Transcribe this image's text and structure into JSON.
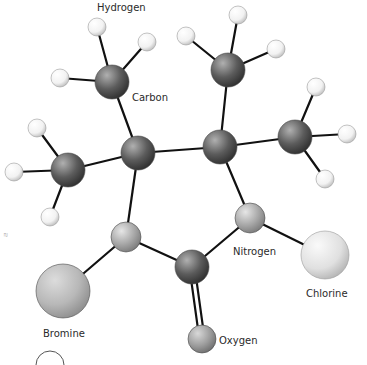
{
  "diagram": {
    "type": "ball-and-stick molecular model",
    "labels": {
      "hydrogen": "Hydrogen",
      "carbon": "Carbon",
      "nitrogen": "Nitrogen",
      "chlorine": "Chlorine",
      "bromine": "Bromine",
      "oxygen": "Oxygen"
    },
    "colors": {
      "carbon": "#5a5a5a",
      "nitrogen": "#a6a6a6",
      "hydrogen": "#f4f4f4",
      "chlorine": "#e2e2e2",
      "bromine": "#b8b8b8",
      "oxygen": "#9c9c9c",
      "bond": "#111111"
    },
    "atoms": [
      {
        "id": "c_ring_left",
        "element": "carbon",
        "x": 138,
        "y": 153,
        "r": 17
      },
      {
        "id": "c_ring_right",
        "element": "carbon",
        "x": 220,
        "y": 147,
        "r": 17
      },
      {
        "id": "n_ring_left",
        "element": "nitrogen",
        "x": 126,
        "y": 237,
        "r": 15
      },
      {
        "id": "n_ring_right",
        "element": "nitrogen",
        "x": 250,
        "y": 218,
        "r": 15
      },
      {
        "id": "c_carbonyl",
        "element": "carbon",
        "x": 192,
        "y": 267,
        "r": 17
      },
      {
        "id": "c_methyl_tl",
        "element": "carbon",
        "x": 112,
        "y": 82,
        "r": 17
      },
      {
        "id": "c_methyl_tr",
        "element": "carbon",
        "x": 228,
        "y": 70,
        "r": 17
      },
      {
        "id": "c_methyl_l",
        "element": "carbon",
        "x": 68,
        "y": 170,
        "r": 17
      },
      {
        "id": "c_methyl_r",
        "element": "carbon",
        "x": 295,
        "y": 137,
        "r": 17
      },
      {
        "id": "o",
        "element": "oxygen",
        "x": 202,
        "y": 339,
        "r": 14
      },
      {
        "id": "br",
        "element": "bromine",
        "x": 63,
        "y": 291,
        "r": 27
      },
      {
        "id": "cl",
        "element": "chlorine",
        "x": 325,
        "y": 255,
        "r": 24
      },
      {
        "id": "h1",
        "element": "hydrogen",
        "x": 97,
        "y": 27,
        "r": 9
      },
      {
        "id": "h2",
        "element": "hydrogen",
        "x": 147,
        "y": 42,
        "r": 9
      },
      {
        "id": "h3",
        "element": "hydrogen",
        "x": 60,
        "y": 78,
        "r": 9
      },
      {
        "id": "h4",
        "element": "hydrogen",
        "x": 238,
        "y": 15,
        "r": 9
      },
      {
        "id": "h5",
        "element": "hydrogen",
        "x": 186,
        "y": 36,
        "r": 9
      },
      {
        "id": "h6",
        "element": "hydrogen",
        "x": 276,
        "y": 49,
        "r": 9
      },
      {
        "id": "h7",
        "element": "hydrogen",
        "x": 37,
        "y": 128,
        "r": 9
      },
      {
        "id": "h8",
        "element": "hydrogen",
        "x": 14,
        "y": 172,
        "r": 9
      },
      {
        "id": "h9",
        "element": "hydrogen",
        "x": 50,
        "y": 217,
        "r": 9
      },
      {
        "id": "h10",
        "element": "hydrogen",
        "x": 316,
        "y": 87,
        "r": 9
      },
      {
        "id": "h11",
        "element": "hydrogen",
        "x": 347,
        "y": 134,
        "r": 9
      },
      {
        "id": "h12",
        "element": "hydrogen",
        "x": 325,
        "y": 179,
        "r": 9
      }
    ],
    "bonds": [
      [
        "c_ring_left",
        "c_ring_right",
        1
      ],
      [
        "c_ring_right",
        "n_ring_right",
        1
      ],
      [
        "n_ring_right",
        "c_carbonyl",
        1
      ],
      [
        "c_carbonyl",
        "n_ring_left",
        1
      ],
      [
        "n_ring_left",
        "c_ring_left",
        1
      ],
      [
        "c_carbonyl",
        "o",
        2
      ],
      [
        "n_ring_left",
        "br",
        1
      ],
      [
        "n_ring_right",
        "cl",
        1
      ],
      [
        "c_ring_left",
        "c_methyl_tl",
        1
      ],
      [
        "c_ring_left",
        "c_methyl_l",
        1
      ],
      [
        "c_ring_right",
        "c_methyl_tr",
        1
      ],
      [
        "c_ring_right",
        "c_methyl_r",
        1
      ],
      [
        "c_methyl_tl",
        "h1",
        1
      ],
      [
        "c_methyl_tl",
        "h2",
        1
      ],
      [
        "c_methyl_tl",
        "h3",
        1
      ],
      [
        "c_methyl_tr",
        "h4",
        1
      ],
      [
        "c_methyl_tr",
        "h5",
        1
      ],
      [
        "c_methyl_tr",
        "h6",
        1
      ],
      [
        "c_methyl_l",
        "h7",
        1
      ],
      [
        "c_methyl_l",
        "h8",
        1
      ],
      [
        "c_methyl_l",
        "h9",
        1
      ],
      [
        "c_methyl_r",
        "h10",
        1
      ],
      [
        "c_methyl_r",
        "h11",
        1
      ],
      [
        "c_methyl_r",
        "h12",
        1
      ]
    ]
  }
}
